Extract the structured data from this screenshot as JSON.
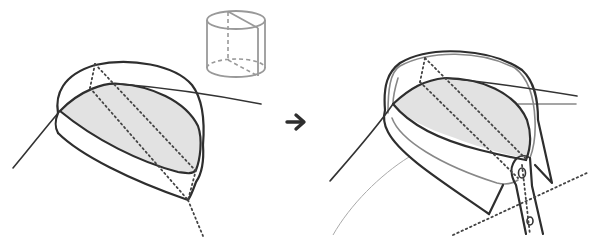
{
  "diagram": {
    "panels": [
      {
        "id": "left",
        "description": "Cylinder-based collar stand with shaded neckline section and dotted guide lines"
      },
      {
        "id": "reference",
        "description": "Small grey reference cylinder with diagonal cut and dashed hidden edges"
      },
      {
        "id": "right",
        "description": "Finished shirt collar with stand, collar leaf, button and buttonhole placket"
      }
    ],
    "arrow": {
      "glyph": "➜",
      "direction": "right"
    },
    "colors": {
      "ink": "#2e2e2e",
      "shade": "#e2e2e2",
      "reference_cylinder": "#999999",
      "background": "#ffffff"
    }
  }
}
